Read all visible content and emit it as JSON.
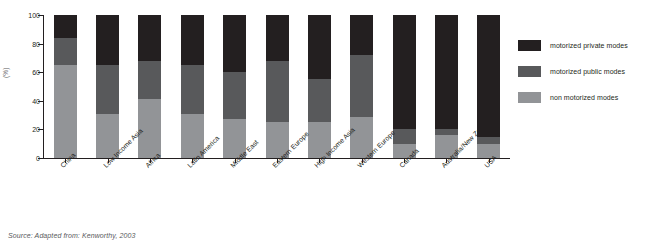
{
  "chart_data": {
    "type": "bar",
    "stacked": true,
    "title": "",
    "xlabel": "",
    "ylabel": "(%)",
    "ylim": [
      0,
      100
    ],
    "yticks": [
      0,
      20,
      40,
      60,
      80,
      100
    ],
    "grid": false,
    "legend_position": "right",
    "categories": [
      "China",
      "Low Income Asia",
      "Africa",
      "Latin America",
      "Middle East",
      "Eastern Europe",
      "High Income Asia",
      "Western Europe",
      "Canada",
      "Australia/New Zealand",
      "USA"
    ],
    "series": [
      {
        "name": "non motorized modes",
        "color": "#929497",
        "values": [
          65,
          31,
          41,
          31,
          27,
          25,
          25,
          29,
          10,
          16,
          10
        ]
      },
      {
        "name": "motorized public modes",
        "color": "#58595b",
        "values": [
          19,
          34,
          27,
          34,
          33,
          43,
          30,
          43,
          10,
          4,
          5
        ]
      },
      {
        "name": "motorized private modes",
        "color": "#231f20",
        "values": [
          16,
          35,
          32,
          35,
          40,
          32,
          45,
          28,
          80,
          80,
          85
        ]
      }
    ]
  },
  "legend": {
    "items": [
      {
        "label": "motorized private modes",
        "color": "#231f20"
      },
      {
        "label": "motorized public modes",
        "color": "#58595b"
      },
      {
        "label": "non motorized modes",
        "color": "#929497"
      }
    ]
  },
  "source": {
    "text": "Source: Adapted from: Kenworthy, 2003"
  }
}
